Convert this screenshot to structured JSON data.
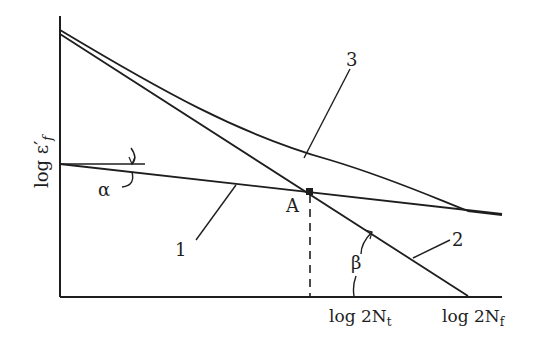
{
  "diagram": {
    "y_axis_label": {
      "main": "log ε",
      "prime": "′",
      "sub": "f"
    },
    "x_ticks": [
      {
        "main": "log 2N",
        "sub": "t"
      },
      {
        "main": "log 2N",
        "sub": "f"
      }
    ],
    "curve_labels": [
      "1",
      "2",
      "3"
    ],
    "point_label": "A",
    "angle_labels": {
      "alpha": "α",
      "beta": "β"
    },
    "colors": {
      "ink": "#1e1e1e",
      "background": "#ffffff"
    }
  }
}
